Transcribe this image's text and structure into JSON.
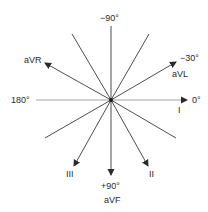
{
  "diagram": {
    "center": {
      "x": 111,
      "y": 100
    },
    "colors": {
      "line": "#3a3a3a",
      "axis_light": "#9a9a9a",
      "text": "#2a2a2a"
    },
    "labels": {
      "minus90": "−90°",
      "minus30": "−30°",
      "zero": "0°",
      "deg180": "180°",
      "plus90": "+90°",
      "aVR": "aVR",
      "aVL": "aVL",
      "aVF": "aVF",
      "I": "I",
      "II": "II",
      "III": "III"
    },
    "leads": [
      {
        "name": "I",
        "angle": 0,
        "arrow": true
      },
      {
        "name": "II",
        "angle": 60,
        "arrow": true
      },
      {
        "name": "III",
        "angle": 120,
        "arrow": true
      },
      {
        "name": "aVR",
        "angle": -150,
        "arrow": true
      },
      {
        "name": "aVL",
        "angle": -30,
        "arrow": true
      },
      {
        "name": "aVF",
        "angle": 90,
        "arrow": true
      }
    ]
  }
}
